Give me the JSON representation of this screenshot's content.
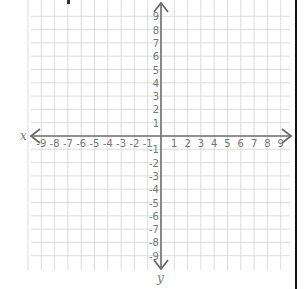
{
  "diagram": {
    "type": "coordinate-plane",
    "x_axis_label": "x",
    "y_axis_label": "y",
    "x_ticks": [
      "-9",
      "-8",
      "-7",
      "-6",
      "-5",
      "-4",
      "-3",
      "-2",
      "-1",
      "1",
      "2",
      "3",
      "4",
      "5",
      "6",
      "7",
      "8",
      "9"
    ],
    "y_ticks": [
      "9",
      "8",
      "7",
      "6",
      "5",
      "4",
      "3",
      "2",
      "1",
      "-1",
      "-2",
      "-3",
      "-4",
      "-5",
      "-6",
      "-7",
      "-8",
      "-9"
    ],
    "x_range": [
      -9,
      9
    ],
    "y_range": [
      -9,
      9
    ],
    "grid": true,
    "colors": {
      "grid": "#d4d4d4",
      "axis": "#6b6b6b",
      "label": "#777777",
      "border": "#111111"
    }
  }
}
